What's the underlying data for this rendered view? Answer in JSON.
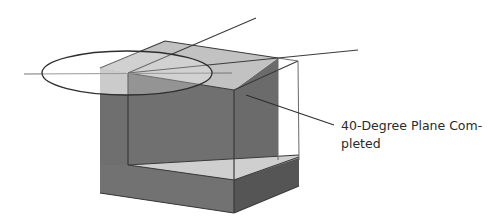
{
  "diagram": {
    "title": "",
    "callout": {
      "line1": "40-Degree Plane Com-",
      "line2": "pleted"
    },
    "colors": {
      "background": "#ffffff",
      "box_dark": "#6e6e6e",
      "box_darker": "#595959",
      "box_mid": "#8a8a8a",
      "top_light": "#c4c4c4",
      "wedge_light": "#cfcfcf",
      "ghost_face": "#bdbdbd",
      "line": "#3c3c3c",
      "ellipse": "#333333"
    }
  }
}
